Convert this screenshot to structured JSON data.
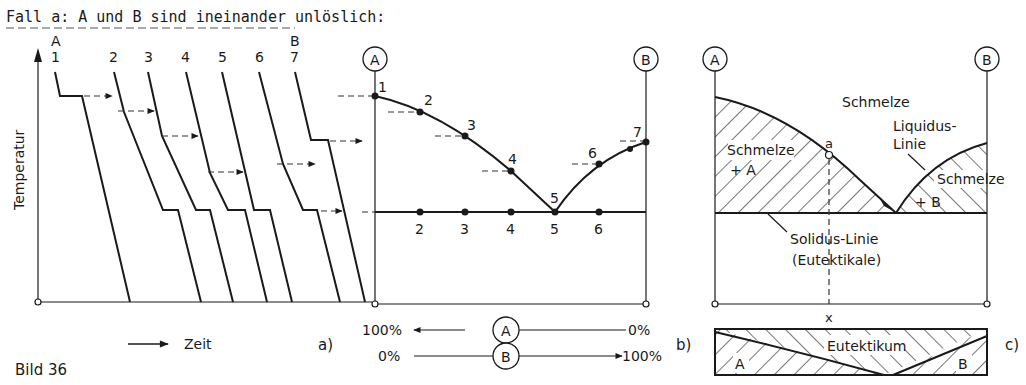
{
  "title": "Fall a: A und B sind ineinander unlöslich:",
  "figure_label": "Bild 36",
  "panel_a": {
    "label": "a)",
    "y_axis_label": "Temperatur",
    "x_axis_label": "Zeit",
    "component_left": "A",
    "component_right": "B",
    "curve_labels": [
      "1",
      "2",
      "3",
      "4",
      "5",
      "6",
      "7"
    ]
  },
  "panel_b": {
    "label": "b)",
    "axis_left": "A",
    "axis_right": "B",
    "liquidus_points": [
      "1",
      "2",
      "3",
      "4",
      "5",
      "6",
      "7"
    ],
    "eutectic_points": [
      "2",
      "3",
      "4",
      "5",
      "6"
    ],
    "scale_A": {
      "left": "100%",
      "mid": "A",
      "right": "0%"
    },
    "scale_B": {
      "left": "0%",
      "mid": "B",
      "right": "100%"
    }
  },
  "panel_c": {
    "label": "c)",
    "axis_left": "A",
    "axis_right": "B",
    "region_melt": "Schmelze",
    "region_melt_A_1": "Schmelze",
    "region_melt_A_2": "+ A",
    "region_melt_B_1": "Schmelze",
    "region_melt_B_2": "+ B",
    "liquidus_1": "Liquidus-",
    "liquidus_2": "Linie",
    "solidus_1": "Solidus-Linie",
    "solidus_2": "(Eutektikale)",
    "point_a": "a",
    "x_marker": "x",
    "structure": {
      "left": "A",
      "center": "Eutektikum",
      "right": "B"
    }
  }
}
